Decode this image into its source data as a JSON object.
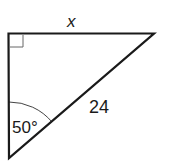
{
  "diagram": {
    "type": "right-triangle",
    "colors": {
      "stroke": "#1a1a1a",
      "background": "#ffffff",
      "right_angle_marker": "#555555"
    },
    "vertices": {
      "top_left": {
        "x": 8,
        "y": 33,
        "note": "right angle"
      },
      "top_right": {
        "x": 154,
        "y": 33
      },
      "bottom": {
        "x": 9,
        "y": 158,
        "note": "50 degree angle"
      }
    },
    "labels": {
      "top_side": "x",
      "hypotenuse": "24",
      "angle": "50°"
    },
    "right_angle_marker": true
  }
}
